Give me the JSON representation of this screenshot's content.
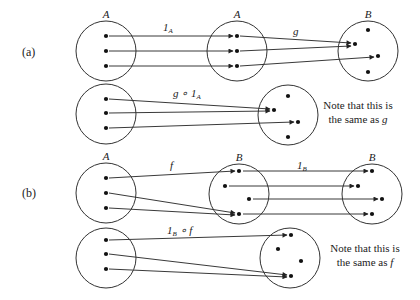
{
  "colors": {
    "stroke": "#333333",
    "dot": "#111111",
    "background": "#ffffff"
  },
  "parts": [
    {
      "id": "a",
      "label": "(a)",
      "label_pos": [
        22,
        56
      ],
      "rows": [
        {
          "sets": [
            {
              "name": "A",
              "cx": 106,
              "cy": 51,
              "r": 30,
              "dots": [
                [
                  106,
                  36
                ],
                [
                  106,
                  51
                ],
                [
                  106,
                  66
                ]
              ]
            },
            {
              "name": "A",
              "cx": 237,
              "cy": 51,
              "r": 30,
              "dots": [
                [
                  237,
                  36
                ],
                [
                  237,
                  51
                ],
                [
                  237,
                  66
                ]
              ]
            },
            {
              "name": "B",
              "cx": 368,
              "cy": 51,
              "r": 30,
              "dots": [
                [
                  368,
                  30
                ],
                [
                  355,
                  44
                ],
                [
                  378,
                  56
                ],
                [
                  368,
                  72
                ]
              ]
            }
          ],
          "maps": [
            {
              "label": "1",
              "sub": "A",
              "label_pos": [
                163,
                31
              ],
              "arrows": [
                [
                  [
                    109,
                    36
                  ],
                  [
                    233,
                    36
                  ]
                ],
                [
                  [
                    109,
                    51
                  ],
                  [
                    233,
                    51
                  ]
                ],
                [
                  [
                    109,
                    66
                  ],
                  [
                    233,
                    66
                  ]
                ]
              ]
            },
            {
              "label": "g",
              "sub": "",
              "label_pos": [
                293,
                35
              ],
              "arrows": [
                [
                  [
                    240,
                    36
                  ],
                  [
                    351,
                    43
                  ]
                ],
                [
                  [
                    240,
                    51
                  ],
                  [
                    351,
                    46
                  ]
                ],
                [
                  [
                    240,
                    66
                  ],
                  [
                    374,
                    57
                  ]
                ]
              ]
            }
          ]
        },
        {
          "sets": [
            {
              "name": "",
              "cx": 106,
              "cy": 114,
              "r": 30,
              "dots": [
                [
                  106,
                  99
                ],
                [
                  106,
                  113
                ],
                [
                  106,
                  128
                ]
              ]
            },
            {
              "name": "",
              "cx": 288,
              "cy": 115,
              "r": 30,
              "dots": [
                [
                  288,
                  96
                ],
                [
                  274,
                  110
                ],
                [
                  298,
                  122
                ],
                [
                  288,
                  137
                ]
              ]
            }
          ],
          "maps": [
            {
              "label": "g ∘ 1",
              "sub": "A",
              "label_pos": [
                173,
                97
              ],
              "arrows": [
                [
                  [
                    109,
                    99
                  ],
                  [
                    270,
                    109
                  ]
                ],
                [
                  [
                    109,
                    113
                  ],
                  [
                    270,
                    111
                  ]
                ],
                [
                  [
                    109,
                    128
                  ],
                  [
                    294,
                    122
                  ]
                ]
              ]
            }
          ],
          "note": {
            "line1": "Note that this is",
            "line2_prefix": "the same as ",
            "line2_var": "g",
            "pos": [
              358,
              109
            ]
          }
        }
      ]
    },
    {
      "id": "b",
      "label": "(b)",
      "label_pos": [
        22,
        197
      ],
      "rows": [
        {
          "sets": [
            {
              "name": "A",
              "cx": 106,
              "cy": 193,
              "r": 30,
              "dots": [
                [
                  106,
                  178
                ],
                [
                  106,
                  193
                ],
                [
                  106,
                  208
                ]
              ]
            },
            {
              "name": "B",
              "cx": 239,
              "cy": 194,
              "r": 30,
              "dots": [
                [
                  239,
                  171
                ],
                [
                  225,
                  186
                ],
                [
                  249,
                  199
                ],
                [
                  239,
                  214
                ]
              ]
            },
            {
              "name": "B",
              "cx": 372,
              "cy": 194,
              "r": 30,
              "dots": [
                [
                  372,
                  171
                ],
                [
                  358,
                  186
                ],
                [
                  382,
                  199
                ],
                [
                  372,
                  214
                ]
              ]
            }
          ],
          "maps": [
            {
              "label": "f",
              "sub": "",
              "label_pos": [
                170,
                169
              ],
              "arrows": [
                [
                  [
                    109,
                    178
                  ],
                  [
                    235,
                    171
                  ]
                ],
                [
                  [
                    109,
                    193
                  ],
                  [
                    235,
                    213
                  ]
                ],
                [
                  [
                    109,
                    208
                  ],
                  [
                    235,
                    215
                  ]
                ]
              ]
            },
            {
              "label": "1",
              "sub": "B",
              "label_pos": [
                297,
                169
              ],
              "arrows": [
                [
                  [
                    243,
                    171
                  ],
                  [
                    368,
                    171
                  ]
                ],
                [
                  [
                    229,
                    186
                  ],
                  [
                    354,
                    186
                  ]
                ],
                [
                  [
                    253,
                    199
                  ],
                  [
                    378,
                    199
                  ]
                ],
                [
                  [
                    243,
                    214
                  ],
                  [
                    368,
                    214
                  ]
                ]
              ]
            }
          ]
        },
        {
          "sets": [
            {
              "name": "",
              "cx": 106,
              "cy": 258,
              "r": 30,
              "dots": [
                [
                  106,
                  240
                ],
                [
                  106,
                  254
                ],
                [
                  106,
                  269
                ]
              ]
            },
            {
              "name": "",
              "cx": 290,
              "cy": 258,
              "r": 30,
              "dots": [
                [
                  291,
                  235
                ],
                [
                  278,
                  249
                ],
                [
                  301,
                  261
                ],
                [
                  291,
                  276
                ]
              ]
            }
          ],
          "maps": [
            {
              "label": "1",
              "sub": "B",
              "suffix": " ∘ f",
              "label_pos": [
                167,
                234
              ],
              "arrows": [
                [
                  [
                    109,
                    240
                  ],
                  [
                    287,
                    235
                  ]
                ],
                [
                  [
                    109,
                    254
                  ],
                  [
                    287,
                    275
                  ]
                ],
                [
                  [
                    109,
                    269
                  ],
                  [
                    287,
                    277
                  ]
                ]
              ]
            }
          ],
          "note": {
            "line1": "Note that this is",
            "line2_prefix": "the same as ",
            "line2_var": "f",
            "pos": [
              365,
              252
            ]
          }
        }
      ]
    }
  ]
}
